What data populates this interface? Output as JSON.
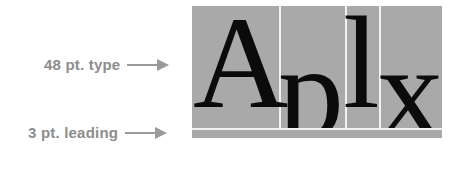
{
  "diagram": {
    "annotations": [
      {
        "label": "48 pt. type",
        "arrow": "right-arrow"
      },
      {
        "label": "3 pt. leading",
        "arrow": "right-arrow"
      }
    ],
    "specimen": {
      "text": "Aplx",
      "letters": [
        "A",
        "p",
        "l",
        "x"
      ]
    },
    "colors": {
      "panel_gray": "#a9a9a9",
      "divider_white": "#f2f2f2",
      "glyph_black": "#0b0b0b",
      "label_gray": "#8d8d8d",
      "arrow_gray": "#9a9a9a",
      "page_background": "#ffffff"
    }
  }
}
